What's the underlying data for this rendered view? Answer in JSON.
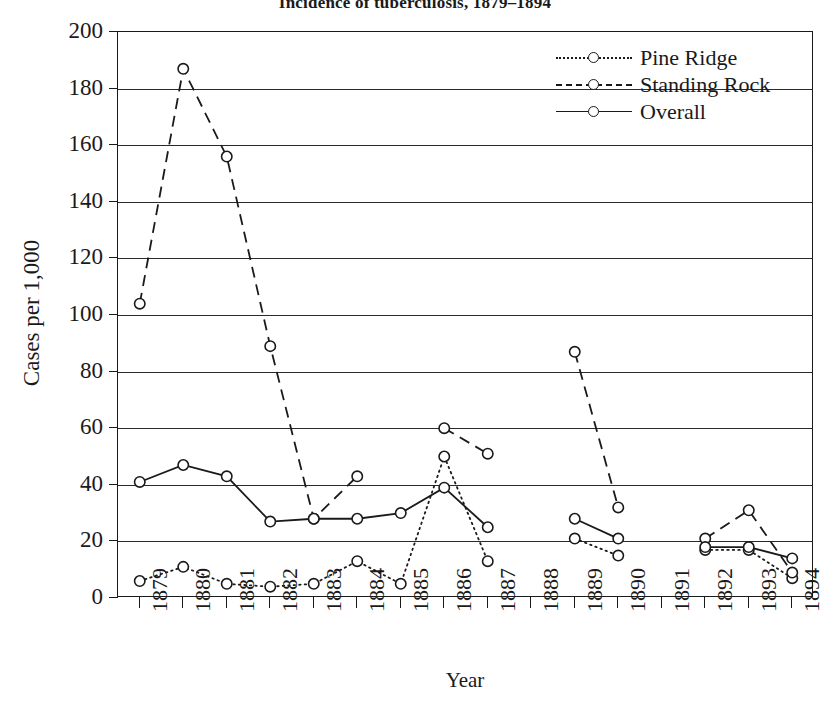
{
  "chart_data": {
    "type": "line",
    "title": "Incidence of tuberculosis, 1879–1894",
    "xlabel": "Year",
    "ylabel": "Cases per 1,000",
    "categories": [
      "1879",
      "1880",
      "1881",
      "1882",
      "1883",
      "1884",
      "1885",
      "1886",
      "1887",
      "1888",
      "1889",
      "1890",
      "1891",
      "1892",
      "1893",
      "1894"
    ],
    "ylim": [
      0,
      200
    ],
    "yticks": [
      0,
      20,
      40,
      60,
      80,
      100,
      120,
      140,
      160,
      180,
      200
    ],
    "ytick_labels": [
      "0",
      "20",
      "40",
      "60",
      "80",
      "100",
      "120",
      "140",
      "160",
      "180",
      "200"
    ],
    "grid": "horizontal",
    "legend_position": "top-right",
    "series": [
      {
        "name": "Pine Ridge",
        "line_style": "dotted",
        "marker": "open-circle",
        "color": "#1a1a1a",
        "values": [
          6,
          11,
          5,
          4,
          5,
          13,
          5,
          50,
          13,
          null,
          21,
          15,
          null,
          17,
          17,
          7
        ]
      },
      {
        "name": "Standing Rock",
        "line_style": "dashed",
        "marker": "open-circle",
        "color": "#1a1a1a",
        "values": [
          104,
          187,
          156,
          89,
          28,
          43,
          null,
          60,
          51,
          null,
          87,
          32,
          null,
          21,
          31,
          9
        ]
      },
      {
        "name": "Overall",
        "line_style": "solid",
        "marker": "open-circle",
        "color": "#1a1a1a",
        "values": [
          41,
          47,
          43,
          27,
          28,
          28,
          30,
          39,
          25,
          null,
          28,
          21,
          null,
          18,
          18,
          14
        ]
      }
    ]
  }
}
